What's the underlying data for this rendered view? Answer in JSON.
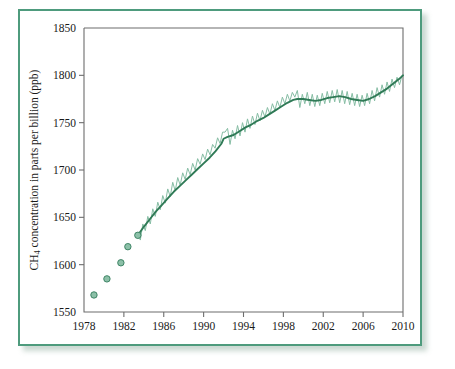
{
  "figure": {
    "frame_color": "#4e9b7d",
    "background": "#ffffff"
  },
  "chart_data": {
    "type": "line",
    "title": "",
    "subtitle": "",
    "xlabel": "Year",
    "ylabel": "CH4 concentration in parts per billion (ppb)",
    "ylabel_parts": {
      "prefix": "CH",
      "subscript": "4",
      "suffix": " concentration in parts per billion (ppb)"
    },
    "xlim": [
      1978,
      2010
    ],
    "ylim": [
      1550,
      1850
    ],
    "xticks": [
      1978,
      1982,
      1986,
      1990,
      1994,
      1998,
      2002,
      2006,
      2010
    ],
    "yticks": [
      1550,
      1600,
      1650,
      1700,
      1750,
      1800,
      1850
    ],
    "grid": false,
    "legend": "none",
    "colors": {
      "trend_line": "#2f7a56",
      "seasonal_line": "#86bda4",
      "marker_fill": "#8cc0a8",
      "marker_edge": "#3f8566",
      "axis": "#6d6d6d"
    },
    "series": [
      {
        "name": "Ice-core / early measurements (discrete markers)",
        "type": "scatter",
        "x": [
          1979.0,
          1980.3,
          1981.7,
          1982.4,
          1983.4
        ],
        "values": [
          1568,
          1585,
          1602,
          1619,
          1631
        ]
      },
      {
        "name": "Smoothed trend",
        "type": "line",
        "x": [
          1983.4,
          1984.0,
          1984.6,
          1985.2,
          1985.8,
          1986.4,
          1987.0,
          1987.6,
          1988.2,
          1988.8,
          1989.4,
          1990.0,
          1990.6,
          1991.2,
          1991.8,
          1992.0,
          1992.4,
          1993.0,
          1993.6,
          1994.2,
          1994.8,
          1995.4,
          1996.0,
          1996.6,
          1997.2,
          1997.8,
          1998.4,
          1999.0,
          1999.4,
          2000.0,
          2000.6,
          2001.2,
          2001.8,
          2002.4,
          2003.0,
          2003.6,
          2004.2,
          2004.8,
          2005.4,
          2006.0,
          2006.6,
          2007.2,
          2007.8,
          2008.4,
          2009.0,
          2009.6,
          2010.0
        ],
        "values": [
          1631,
          1640,
          1648,
          1656,
          1663,
          1670,
          1677,
          1683,
          1689,
          1695,
          1701,
          1707,
          1713,
          1720,
          1728,
          1733,
          1735,
          1737,
          1741,
          1745,
          1748,
          1752,
          1755,
          1759,
          1763,
          1767,
          1771,
          1774,
          1775,
          1775,
          1774,
          1773,
          1774,
          1776,
          1777,
          1778,
          1777,
          1775,
          1774,
          1773,
          1775,
          1778,
          1782,
          1786,
          1791,
          1796,
          1800
        ]
      },
      {
        "name": "Monthly record with seasonal cycle",
        "type": "line",
        "x": [
          1983.4,
          1983.65,
          1983.9,
          1984.15,
          1984.4,
          1984.65,
          1984.9,
          1985.15,
          1985.4,
          1985.65,
          1985.9,
          1986.15,
          1986.4,
          1986.65,
          1986.9,
          1987.15,
          1987.4,
          1987.65,
          1987.9,
          1988.15,
          1988.4,
          1988.65,
          1988.9,
          1989.15,
          1989.4,
          1989.65,
          1989.9,
          1990.15,
          1990.4,
          1990.65,
          1990.9,
          1991.15,
          1991.4,
          1991.65,
          1991.9,
          1992.15,
          1992.4,
          1992.65,
          1992.9,
          1993.15,
          1993.4,
          1993.65,
          1993.9,
          1994.15,
          1994.4,
          1994.65,
          1994.9,
          1995.15,
          1995.4,
          1995.65,
          1995.9,
          1996.15,
          1996.4,
          1996.65,
          1996.9,
          1997.15,
          1997.4,
          1997.65,
          1997.9,
          1998.15,
          1998.4,
          1998.65,
          1998.9,
          1999.15,
          1999.4,
          1999.65,
          1999.9,
          2000.15,
          2000.4,
          2000.65,
          2000.9,
          2001.15,
          2001.4,
          2001.65,
          2001.9,
          2002.15,
          2002.4,
          2002.65,
          2002.9,
          2003.15,
          2003.4,
          2003.65,
          2003.9,
          2004.15,
          2004.4,
          2004.65,
          2004.9,
          2005.15,
          2005.4,
          2005.65,
          2005.9,
          2006.15,
          2006.4,
          2006.65,
          2006.9,
          2007.15,
          2007.4,
          2007.65,
          2007.9,
          2008.15,
          2008.4,
          2008.65,
          2008.9,
          2009.15,
          2009.4,
          2009.65,
          2009.9,
          2010.0
        ],
        "values": [
          1634,
          1626,
          1643,
          1636,
          1651,
          1643,
          1659,
          1651,
          1666,
          1658,
          1673,
          1665,
          1680,
          1672,
          1687,
          1678,
          1692,
          1684,
          1697,
          1690,
          1702,
          1695,
          1707,
          1700,
          1712,
          1706,
          1717,
          1711,
          1722,
          1716,
          1727,
          1723,
          1734,
          1728,
          1740,
          1740,
          1744,
          1727,
          1742,
          1733,
          1747,
          1736,
          1750,
          1740,
          1754,
          1744,
          1757,
          1748,
          1760,
          1752,
          1763,
          1756,
          1766,
          1759,
          1770,
          1763,
          1773,
          1766,
          1777,
          1770,
          1780,
          1773,
          1782,
          1777,
          1784,
          1766,
          1780,
          1770,
          1782,
          1768,
          1780,
          1767,
          1779,
          1768,
          1781,
          1770,
          1783,
          1771,
          1784,
          1772,
          1785,
          1771,
          1784,
          1770,
          1783,
          1769,
          1781,
          1768,
          1780,
          1767,
          1779,
          1768,
          1781,
          1770,
          1784,
          1773,
          1787,
          1777,
          1790,
          1780,
          1793,
          1783,
          1796,
          1787,
          1798,
          1790,
          1800,
          1800
        ]
      }
    ]
  }
}
